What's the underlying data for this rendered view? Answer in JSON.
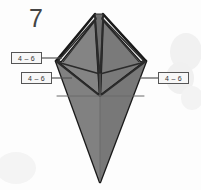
{
  "diagram": {
    "step_number": "7",
    "type": "origami-fold-diagram",
    "callouts": [
      {
        "id": "upper-left",
        "text": "4 – 6"
      },
      {
        "id": "lower-left",
        "text": "4 – 6"
      },
      {
        "id": "right",
        "text": "4 – 6"
      }
    ],
    "colors": {
      "paper_face": "#808080",
      "paper_face_light": "#8d8d8d",
      "paper_face_dark": "#6f6f6f",
      "outline": "#1a1a1a",
      "crease": "#3a3a3a",
      "layer_highlight": "#f2f2f2",
      "label_border": "#555555",
      "label_fill": "#f7f7f7",
      "label_text": "#333333",
      "step_text": "#444444",
      "background": "#fdfdfd",
      "background_blob": "#f1f1f1"
    },
    "shape": {
      "apex_left_x": 95,
      "apex_right_x": 103,
      "apex_y": 14,
      "wing_left_x": 56,
      "wing_right_x": 146,
      "wing_y": 61,
      "mid_y": 96,
      "bottom_tip_x": 100,
      "bottom_tip_y": 182,
      "center_x": 100
    }
  }
}
